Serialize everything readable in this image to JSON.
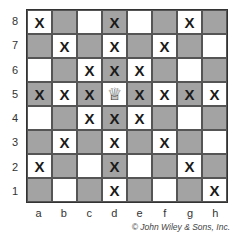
{
  "diagram": {
    "piece": {
      "type": "queen",
      "square": "d5",
      "glyph": "♕"
    },
    "ranks": [
      "8",
      "7",
      "6",
      "5",
      "4",
      "3",
      "2",
      "1"
    ],
    "files": [
      "a",
      "b",
      "c",
      "d",
      "e",
      "f",
      "g",
      "h"
    ],
    "mark": "X",
    "attacked_squares": [
      "a8",
      "d8",
      "g8",
      "b7",
      "d7",
      "f7",
      "c6",
      "d6",
      "e6",
      "a5",
      "b5",
      "c5",
      "e5",
      "f5",
      "g5",
      "h5",
      "c4",
      "d4",
      "e4",
      "b3",
      "d3",
      "f3",
      "a2",
      "d2",
      "g2",
      "d1",
      "h1"
    ],
    "colors": {
      "dark": "#a3a3a3",
      "light": "#ffffff",
      "border": "#333333"
    },
    "credit": "© John Wiley & Sons, Inc."
  }
}
